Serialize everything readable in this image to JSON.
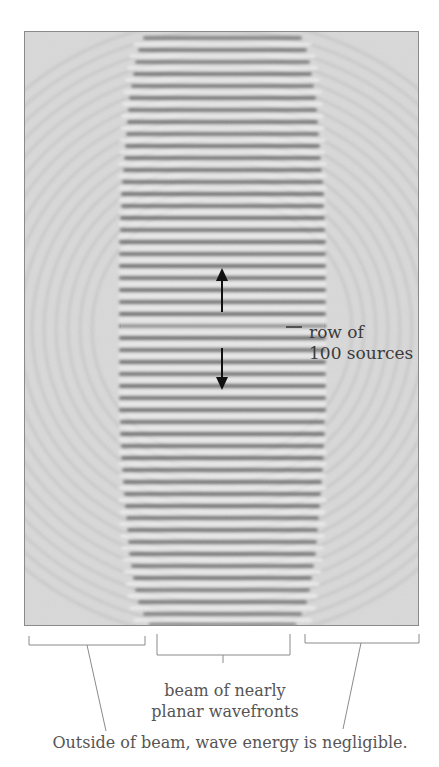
{
  "figure": {
    "title": "",
    "source_label_line1": "row of",
    "source_label_line2": "100 sources",
    "beam_label_line1": "beam of nearly",
    "beam_label_line2": "planar wavefronts",
    "outside_label": "Outside of beam, wave energy is negligible.",
    "arrow_up": "arrow-up",
    "arrow_down": "arrow-down",
    "colors": {
      "background": "#d9d9d9",
      "frame": "#8a8a8a",
      "wave_dark": "#6f6f6f",
      "wave_light": "#f4f4f4",
      "text": "#4a4a4a",
      "lines": "#8a8a8a"
    }
  }
}
